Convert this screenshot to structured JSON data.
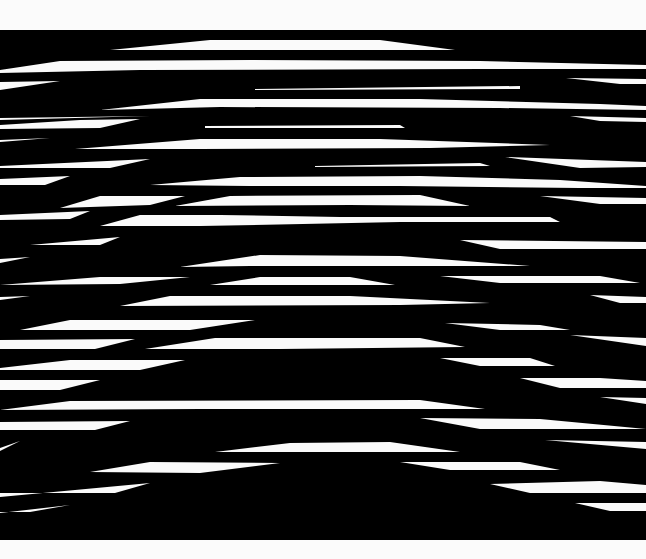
{
  "artwork": {
    "description": "Op-art composition of tapered white horizontal stripes on black",
    "colors": {
      "background": "#fbfbfb",
      "field": "#000000",
      "stripe": "#fafafa"
    },
    "field": {
      "x": 0,
      "y": 30,
      "width": 646,
      "height": 510
    },
    "stripes": [
      [
        110,
        50,
        210,
        40,
        380,
        40,
        455,
        50
      ],
      [
        0,
        70,
        60,
        61,
        250,
        60,
        480,
        61,
        646,
        65,
        646,
        69,
        480,
        69,
        140,
        70,
        0,
        73
      ],
      [
        0,
        90,
        60,
        81,
        0,
        82
      ],
      [
        255,
        89,
        520,
        86,
        520,
        89,
        255,
        90
      ],
      [
        566,
        78,
        646,
        79,
        646,
        84,
        620,
        84
      ],
      [
        100,
        110,
        200,
        99,
        420,
        99,
        600,
        104,
        646,
        106,
        646,
        110,
        500,
        108,
        220,
        107
      ],
      [
        0,
        118,
        150,
        116,
        0,
        120
      ],
      [
        570,
        116,
        646,
        118,
        646,
        122,
        600,
        121
      ],
      [
        0,
        125,
        80,
        120,
        140,
        119,
        100,
        128,
        0,
        129
      ],
      [
        205,
        126,
        400,
        125,
        405,
        128,
        205,
        128
      ],
      [
        0,
        140,
        50,
        138,
        0,
        142
      ],
      [
        75,
        149,
        200,
        139,
        380,
        139,
        550,
        145,
        430,
        148,
        200,
        149
      ],
      [
        0,
        166,
        150,
        159,
        110,
        168,
        0,
        168
      ],
      [
        315,
        166,
        480,
        163,
        490,
        166,
        315,
        167
      ],
      [
        505,
        157,
        646,
        162,
        646,
        167,
        580,
        168
      ],
      [
        0,
        179,
        70,
        176,
        45,
        185,
        0,
        185
      ],
      [
        150,
        185,
        240,
        177,
        420,
        176,
        560,
        180,
        646,
        186,
        646,
        188,
        580,
        188,
        400,
        186,
        250,
        186
      ],
      [
        60,
        208,
        100,
        196,
        185,
        196,
        150,
        205
      ],
      [
        175,
        206,
        230,
        196,
        420,
        195,
        470,
        206,
        350,
        205
      ],
      [
        540,
        196,
        646,
        198,
        646,
        204,
        600,
        204
      ],
      [
        0,
        215,
        90,
        211,
        70,
        219,
        0,
        220
      ],
      [
        100,
        226,
        140,
        215,
        220,
        215,
        340,
        217,
        550,
        217,
        560,
        222,
        400,
        222,
        200,
        226
      ],
      [
        30,
        245,
        120,
        237,
        100,
        245
      ],
      [
        460,
        240,
        646,
        242,
        646,
        249,
        500,
        249
      ],
      [
        0,
        259,
        30,
        257,
        0,
        263
      ],
      [
        180,
        267,
        260,
        255,
        400,
        256,
        530,
        266,
        400,
        266,
        250,
        266
      ],
      [
        0,
        285,
        100,
        277,
        190,
        277,
        120,
        284
      ],
      [
        210,
        285,
        260,
        277,
        350,
        277,
        395,
        285
      ],
      [
        440,
        276,
        600,
        276,
        640,
        283,
        500,
        283
      ],
      [
        0,
        297,
        30,
        296,
        0,
        300
      ],
      [
        120,
        306,
        170,
        296,
        350,
        296,
        490,
        303,
        400,
        305
      ],
      [
        590,
        295,
        646,
        297,
        646,
        303,
        620,
        303
      ],
      [
        20,
        330,
        70,
        320,
        255,
        320,
        190,
        330
      ],
      [
        445,
        323,
        540,
        325,
        570,
        330,
        500,
        330
      ],
      [
        0,
        340,
        135,
        339,
        95,
        349,
        0,
        349
      ],
      [
        145,
        349,
        215,
        338,
        420,
        338,
        465,
        347,
        280,
        349
      ],
      [
        570,
        335,
        646,
        338,
        646,
        346
      ],
      [
        0,
        368,
        70,
        360,
        185,
        360,
        140,
        370,
        0,
        370
      ],
      [
        440,
        358,
        530,
        358,
        555,
        366,
        480,
        366
      ],
      [
        0,
        380,
        100,
        380,
        60,
        390,
        0,
        390
      ],
      [
        520,
        378,
        600,
        378,
        646,
        381,
        646,
        388,
        560,
        388
      ],
      [
        600,
        397,
        646,
        398,
        646,
        404
      ],
      [
        0,
        410,
        70,
        401,
        420,
        400,
        485,
        409,
        200,
        409
      ],
      [
        420,
        418,
        540,
        419,
        646,
        429,
        480,
        429
      ],
      [
        0,
        422,
        130,
        421,
        95,
        430,
        0,
        430
      ],
      [
        545,
        440,
        646,
        442,
        646,
        449
      ],
      [
        0,
        448,
        20,
        441,
        0,
        451
      ],
      [
        215,
        452,
        290,
        443,
        390,
        442,
        460,
        452
      ],
      [
        90,
        472,
        150,
        462,
        280,
        463,
        200,
        473
      ],
      [
        400,
        462,
        520,
        462,
        560,
        470,
        450,
        470
      ],
      [
        0,
        497,
        150,
        483,
        115,
        493,
        0,
        493
      ],
      [
        490,
        484,
        600,
        481,
        646,
        485,
        646,
        493,
        530,
        493
      ],
      [
        0,
        513,
        70,
        505,
        30,
        512,
        0,
        512
      ],
      [
        575,
        503,
        646,
        503,
        646,
        511,
        610,
        511
      ]
    ]
  }
}
